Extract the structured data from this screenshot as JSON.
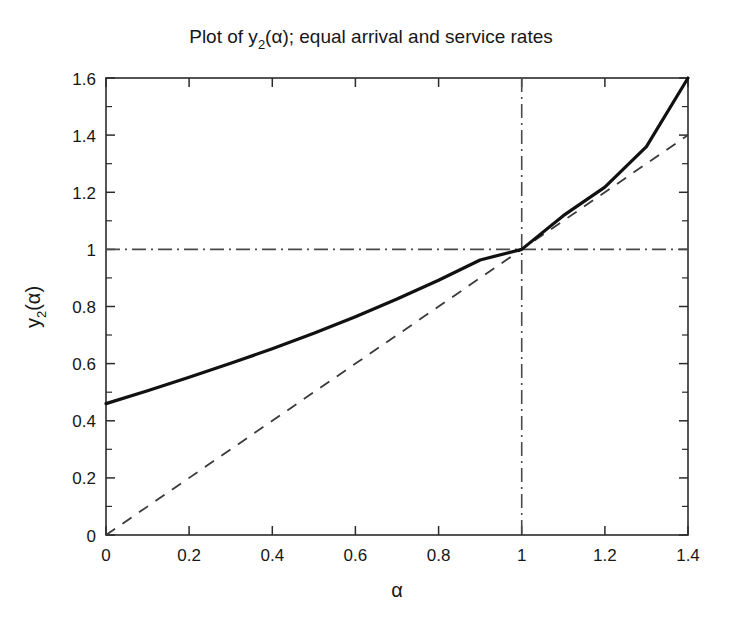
{
  "chart_data": {
    "type": "line",
    "title_parts": {
      "prefix": "Plot of y",
      "subscript": "2",
      "suffix": "(α); equal arrival and service rates"
    },
    "xlabel": "α",
    "ylabel": "y_2(α)",
    "ylabel_parts": {
      "prefix": "y",
      "subscript": "2",
      "suffix": "(α)"
    },
    "xlim": [
      0,
      1.4
    ],
    "ylim": [
      0,
      1.6
    ],
    "xticks": [
      0,
      0.2,
      0.4,
      0.6,
      0.8,
      1,
      1.2,
      1.4
    ],
    "xticklabels": [
      "0",
      "0.2",
      "0.4",
      "0.6",
      "0.8",
      "1",
      "1.2",
      "1.4"
    ],
    "yticks": [
      0,
      0.2,
      0.4,
      0.6,
      0.8,
      1,
      1.2,
      1.4,
      1.6
    ],
    "yticklabels": [
      "0",
      "0.2",
      "0.4",
      "0.6",
      "0.8",
      "1",
      "1.2",
      "1.4",
      "1.6"
    ],
    "grid": false,
    "legend": "none",
    "box": true,
    "series": [
      {
        "name": "y_2(alpha)",
        "style": "solid",
        "color": "#111111",
        "x": [
          0.0,
          0.1,
          0.2,
          0.3,
          0.4,
          0.5,
          0.6,
          0.7,
          0.8,
          0.9,
          1.0,
          1.1,
          1.2,
          1.3,
          1.4
        ],
        "y": [
          0.46,
          0.505,
          0.552,
          0.601,
          0.652,
          0.706,
          0.764,
          0.826,
          0.892,
          0.963,
          1.0,
          1.118,
          1.218,
          1.36,
          1.6
        ]
      },
      {
        "name": "identity y = alpha",
        "style": "dashed",
        "color": "#3a3a3a",
        "x": [
          0.0,
          1.4
        ],
        "y": [
          0.0,
          1.4
        ]
      }
    ],
    "reference_lines": [
      {
        "name": "vertical-alpha-equals-1",
        "orientation": "vertical",
        "value": 1,
        "style": "dash-dot",
        "color": "#4a4a4a"
      },
      {
        "name": "horizontal-y-equals-1",
        "orientation": "horizontal",
        "value": 1,
        "style": "dash-dot",
        "color": "#4a4a4a"
      }
    ],
    "annotations": {
      "intersection_point": {
        "x": 1,
        "y": 1
      },
      "curve_start_value": 0.46,
      "curve_end_value": 1.6
    }
  }
}
